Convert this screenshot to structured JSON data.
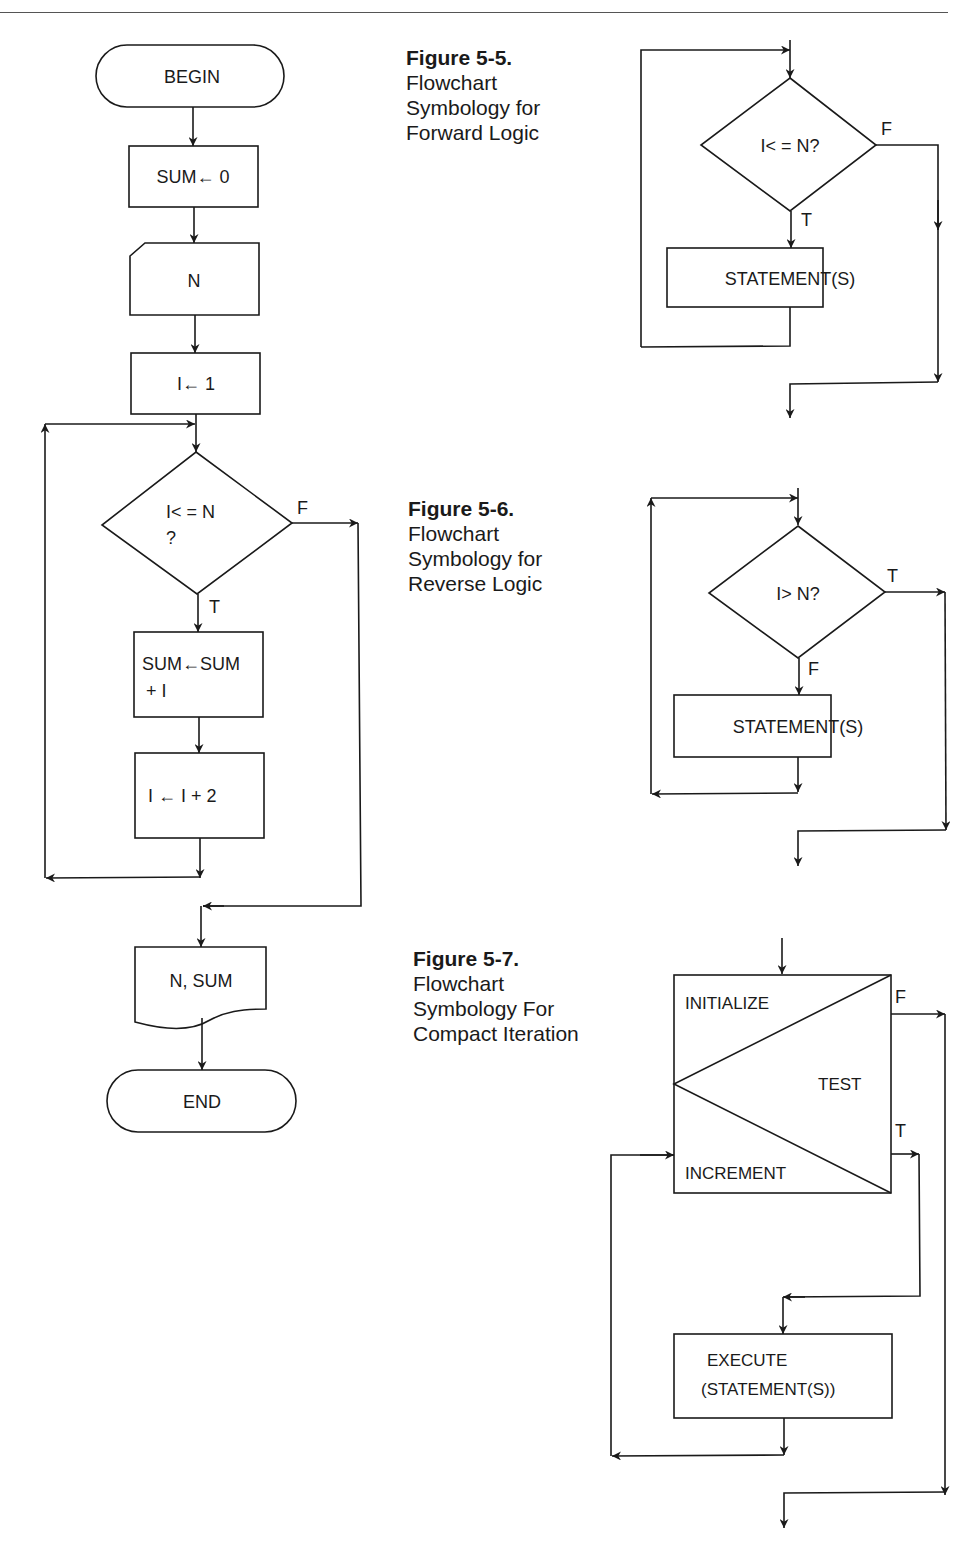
{
  "figures": [
    {
      "id": "5-5",
      "number": "Figure 5-5.",
      "caption_lines": [
        "Flowchart",
        "Symbology for",
        "Forward Logic"
      ],
      "decision": "I< = N?",
      "true_label": "T",
      "false_label": "F",
      "process": "STATEMENT(S)"
    },
    {
      "id": "5-6",
      "number": "Figure 5-6.",
      "caption_lines": [
        "Flowchart",
        "Symbology for",
        "Reverse Logic"
      ],
      "decision": "I> N?",
      "true_label": "T",
      "false_label": "F",
      "process": "STATEMENT(S)"
    },
    {
      "id": "5-7",
      "number": "Figure 5-7.",
      "caption_lines": [
        "Flowchart",
        "Symbology For",
        "Compact Iteration"
      ],
      "initialize": "INITIALIZE",
      "test": "TEST",
      "increment": "INCREMENT",
      "true_label": "T",
      "false_label": "F",
      "execute_line1": "EXECUTE",
      "execute_line2": "(STATEMENT(S))"
    }
  ],
  "main_flowchart": {
    "begin": "BEGIN",
    "init_sum": "SUM← 0",
    "input_n": "N",
    "init_i": "I← 1",
    "decision_line1": "I< = N",
    "decision_line2": "?",
    "true_label": "T",
    "false_label": "F",
    "sum_update_line1": "SUM←SUM",
    "sum_update_line2": "+ I",
    "i_update": "I ← I + 2",
    "output": "N, SUM",
    "end": "END"
  }
}
